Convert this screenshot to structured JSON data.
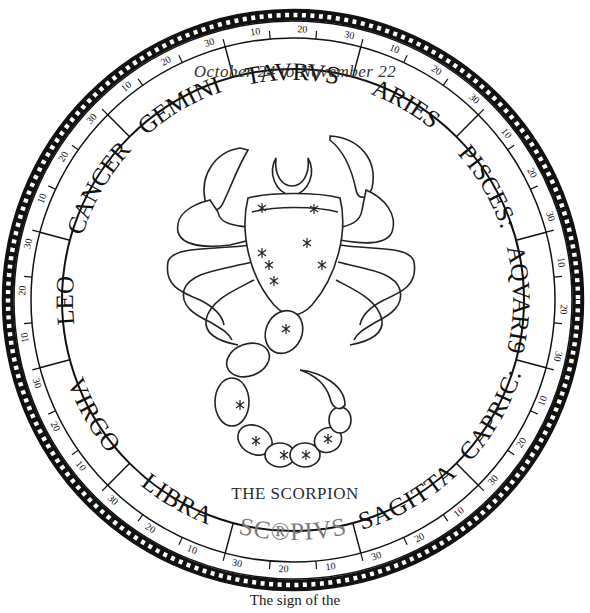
{
  "illustration": {
    "date_range": "October 24 to November 22",
    "caption": "THE SCORPION",
    "bottom_caption": "The sign of the",
    "highlight_color": "#7a7a7a",
    "ink_color": "#111111"
  },
  "zodiac_ring": {
    "signs": [
      {
        "label": "ARIES",
        "angle": 300,
        "highlight": false
      },
      {
        "label": "TAVRVS",
        "angle": 270,
        "highlight": false
      },
      {
        "label": "GEMINI",
        "angle": 240,
        "highlight": false
      },
      {
        "label": "CANCER",
        "angle": 210,
        "highlight": false
      },
      {
        "label": "LEO",
        "angle": 180,
        "highlight": false
      },
      {
        "label": "VIRGO",
        "angle": 150,
        "highlight": false
      },
      {
        "label": "LIBRA",
        "angle": 120,
        "highlight": false
      },
      {
        "label": "SC®PIVS",
        "angle": 90,
        "highlight": true
      },
      {
        "label": "SAGITTA",
        "angle": 60,
        "highlight": false
      },
      {
        "label": "CAPRIC:",
        "angle": 30,
        "highlight": false
      },
      {
        "label": "AQVARI9",
        "angle": 0,
        "highlight": false
      },
      {
        "label": "PISCES:",
        "angle": 330,
        "highlight": false
      }
    ],
    "degree_marks": [
      "10",
      "20",
      "30"
    ]
  },
  "figure": {
    "icon": "scorpion-constellation-icon",
    "moon_icon": "crescent-moon-icon",
    "star_icon": "star-icon"
  }
}
